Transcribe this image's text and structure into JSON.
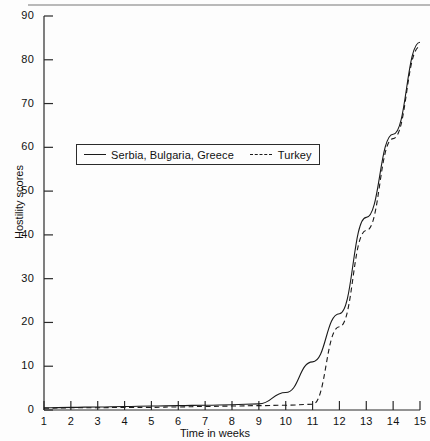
{
  "chart_data": {
    "type": "line",
    "title": "",
    "xlabel": "Time in weeks",
    "ylabel": "Hostility scores",
    "x": [
      1,
      2,
      3,
      4,
      5,
      6,
      7,
      8,
      9,
      10,
      11,
      12,
      13,
      14,
      15
    ],
    "xlim": [
      1,
      15
    ],
    "ylim": [
      0,
      90
    ],
    "xticks": [
      "1",
      "2",
      "3",
      "4",
      "5",
      "6",
      "7",
      "8",
      "9",
      "10",
      "11",
      "12",
      "13",
      "14",
      "15"
    ],
    "yticks": [
      "0",
      "10",
      "20",
      "30",
      "40",
      "50",
      "60",
      "70",
      "80",
      "90"
    ],
    "grid": false,
    "legend_position": "upper-left-inset",
    "series": [
      {
        "name": "Serbia, Bulgaria, Greece",
        "style": "solid",
        "color": "#1a1a1a",
        "values": [
          0.5,
          0.6,
          0.7,
          0.8,
          0.9,
          1.0,
          1.1,
          1.2,
          1.4,
          4.0,
          11.0,
          22.0,
          44.0,
          63.0,
          84.0
        ]
      },
      {
        "name": "Turkey",
        "style": "dashed",
        "color": "#1a1a1a",
        "values": [
          0.4,
          0.5,
          0.5,
          0.6,
          0.6,
          0.7,
          0.8,
          0.9,
          1.0,
          1.1,
          1.3,
          19.0,
          41.0,
          62.0,
          83.0
        ]
      }
    ]
  },
  "legend": {
    "items": [
      {
        "label": "Serbia, Bulgaria, Greece",
        "marker": "solid-line-swatch"
      },
      {
        "label": "Turkey",
        "marker": "dashed-line-swatch"
      }
    ]
  },
  "axes": {
    "y_axis_title": "Hostility scores",
    "x_axis_title": "Time in weeks"
  },
  "colors": {
    "line": "#1a1a1a",
    "axis": "#2b2b2b",
    "background": "#fdfdfd",
    "top_rule": "#b9b9b9"
  }
}
